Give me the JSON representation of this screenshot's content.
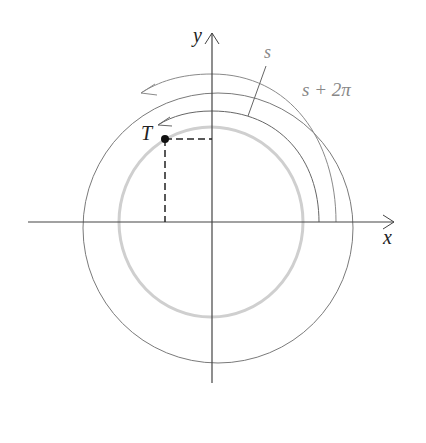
{
  "diagram": {
    "labels": {
      "x_axis": "x",
      "y_axis": "y",
      "point": "T",
      "arc_s": "s",
      "arc_s_plus_2pi": "s + 2π"
    },
    "colors": {
      "axis": "#444444",
      "circle": "#777777",
      "unit_circle": "#c8c8c8",
      "arrow_arc": "#999999",
      "point": "#111111"
    }
  }
}
